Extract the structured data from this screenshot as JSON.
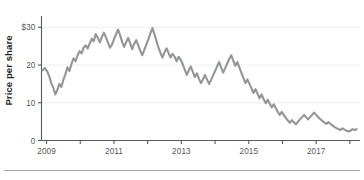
{
  "figure": {
    "axis_label_y": "Price per share",
    "line_color": "#939598",
    "axis_color": "#58585a",
    "grid_color": "#ededee",
    "rule_color": "#a7a9ac",
    "background": "#ffffff"
  },
  "chart_data": {
    "type": "line",
    "title": "",
    "xlabel": "",
    "ylabel": "Price per share",
    "grid": true,
    "legend": null,
    "xlim": [
      2008.85,
      2018.3
    ],
    "ylim": [
      0,
      33
    ],
    "ytick_labels": [
      "0",
      "10",
      "20",
      "$30"
    ],
    "ytick_values": [
      0,
      10,
      20,
      30
    ],
    "xtick_labels": [
      "2009",
      "2011",
      "2013",
      "2015",
      "2017"
    ],
    "xtick_values": [
      2009,
      2011,
      2013,
      2015,
      2017
    ],
    "xtick_minor_values": [
      2010,
      2012,
      2014,
      2016,
      2018
    ],
    "series": [
      {
        "name": "Price per share",
        "x": [
          2008.88,
          2008.95,
          2009.02,
          2009.08,
          2009.14,
          2009.2,
          2009.26,
          2009.32,
          2009.38,
          2009.44,
          2009.5,
          2009.56,
          2009.62,
          2009.68,
          2009.74,
          2009.8,
          2009.86,
          2009.92,
          2009.98,
          2010.04,
          2010.1,
          2010.16,
          2010.22,
          2010.28,
          2010.34,
          2010.4,
          2010.46,
          2010.52,
          2010.58,
          2010.64,
          2010.7,
          2010.76,
          2010.82,
          2010.88,
          2010.94,
          2011.0,
          2011.06,
          2011.12,
          2011.18,
          2011.24,
          2011.3,
          2011.36,
          2011.42,
          2011.48,
          2011.54,
          2011.6,
          2011.66,
          2011.72,
          2011.78,
          2011.84,
          2011.9,
          2011.96,
          2012.02,
          2012.08,
          2012.14,
          2012.2,
          2012.26,
          2012.32,
          2012.38,
          2012.44,
          2012.5,
          2012.56,
          2012.62,
          2012.68,
          2012.74,
          2012.8,
          2012.86,
          2012.92,
          2012.98,
          2013.04,
          2013.1,
          2013.16,
          2013.22,
          2013.28,
          2013.34,
          2013.4,
          2013.46,
          2013.52,
          2013.58,
          2013.64,
          2013.7,
          2013.76,
          2013.82,
          2013.88,
          2013.94,
          2014.0,
          2014.06,
          2014.12,
          2014.18,
          2014.24,
          2014.3,
          2014.36,
          2014.42,
          2014.48,
          2014.54,
          2014.6,
          2014.66,
          2014.72,
          2014.78,
          2014.84,
          2014.9,
          2014.96,
          2015.02,
          2015.08,
          2015.14,
          2015.2,
          2015.26,
          2015.32,
          2015.38,
          2015.44,
          2015.5,
          2015.56,
          2015.62,
          2015.68,
          2015.74,
          2015.8,
          2015.86,
          2015.92,
          2015.98,
          2016.04,
          2016.1,
          2016.16,
          2016.22,
          2016.28,
          2016.34,
          2016.4,
          2016.46,
          2016.52,
          2016.58,
          2016.64,
          2016.7,
          2016.76,
          2016.82,
          2016.88,
          2016.94,
          2017.0,
          2017.06,
          2017.12,
          2017.18,
          2017.24,
          2017.3,
          2017.36,
          2017.42,
          2017.48,
          2017.54,
          2017.6,
          2017.66,
          2017.72,
          2017.78,
          2017.84,
          2017.9,
          2017.96,
          2018.02,
          2018.08,
          2018.14,
          2018.2
        ],
        "y": [
          18.6,
          19.2,
          18.3,
          17.0,
          15.2,
          14.0,
          12.2,
          13.4,
          15.0,
          14.2,
          16.1,
          17.6,
          19.4,
          18.4,
          20.3,
          21.8,
          21.0,
          22.6,
          23.7,
          23.1,
          24.6,
          25.2,
          24.4,
          25.7,
          27.0,
          26.3,
          28.2,
          27.2,
          26.0,
          27.4,
          28.6,
          27.4,
          26.0,
          24.6,
          25.4,
          26.8,
          28.1,
          29.4,
          28.0,
          26.2,
          24.8,
          26.0,
          27.2,
          25.8,
          24.2,
          25.6,
          26.6,
          25.2,
          23.8,
          22.6,
          24.0,
          25.4,
          26.8,
          28.4,
          29.8,
          28.2,
          26.4,
          24.6,
          23.2,
          22.0,
          23.4,
          24.4,
          23.2,
          22.0,
          23.0,
          22.2,
          21.0,
          22.2,
          21.4,
          20.2,
          18.8,
          17.4,
          18.6,
          19.6,
          18.2,
          16.8,
          17.8,
          16.4,
          15.2,
          16.2,
          17.4,
          16.2,
          15.0,
          16.0,
          17.2,
          18.4,
          19.6,
          20.8,
          19.4,
          18.0,
          19.2,
          20.4,
          21.6,
          22.6,
          21.2,
          19.8,
          20.8,
          19.4,
          18.0,
          16.6,
          15.2,
          16.2,
          15.0,
          13.8,
          12.6,
          13.6,
          12.4,
          11.2,
          12.2,
          11.0,
          9.9,
          10.8,
          9.8,
          8.8,
          9.6,
          8.6,
          7.6,
          6.8,
          7.6,
          6.8,
          6.0,
          5.3,
          4.7,
          5.4,
          4.8,
          4.3,
          5.0,
          5.6,
          6.2,
          6.8,
          6.2,
          5.6,
          6.2,
          6.8,
          7.4,
          6.8,
          6.2,
          5.7,
          5.2,
          4.8,
          4.4,
          4.9,
          4.4,
          4.0,
          3.6,
          3.3,
          3.0,
          2.8,
          3.2,
          2.9,
          2.6,
          2.4,
          2.6,
          3.0,
          2.8,
          3.0
        ]
      }
    ]
  }
}
